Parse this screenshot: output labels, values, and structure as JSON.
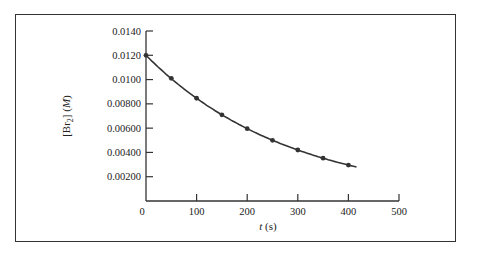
{
  "chart_data": {
    "type": "line",
    "title": "",
    "xlabel": "t (s)",
    "ylabel": "[Br2] (M)",
    "x": [
      0,
      50,
      100,
      150,
      200,
      250,
      300,
      350,
      400
    ],
    "series": [
      {
        "name": "[Br2]",
        "values": [
          0.012,
          0.0101,
          0.00846,
          0.0071,
          0.00596,
          0.005,
          0.0042,
          0.00353,
          0.00296
        ],
        "markers": true
      }
    ],
    "xlim": [
      0,
      500
    ],
    "ylim": [
      0,
      0.014
    ],
    "xticks": [
      "0",
      "100",
      "200",
      "300",
      "400",
      "500"
    ],
    "yticks": [
      "0.00200",
      "0.00400",
      "0.00600",
      "0.00800",
      "0.0100",
      "0.0120",
      "0.0140"
    ],
    "grid": false,
    "legend": "none",
    "colors": {
      "line": "#333333",
      "axis": "#333333"
    }
  },
  "labels": {
    "x_title_italic": "t",
    "x_title_unit": " (s)",
    "y_title_prefix": "[Br",
    "y_title_sub": "2",
    "y_title_suffix": "] (",
    "y_title_unit": "M",
    "y_title_close": ")"
  }
}
